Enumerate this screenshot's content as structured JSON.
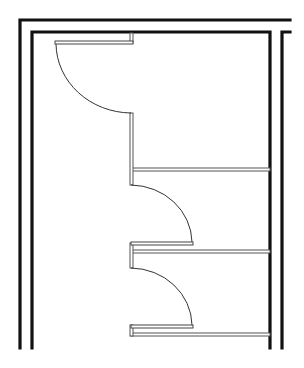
{
  "diagram": {
    "type": "floor-plan",
    "colors": {
      "wall": "#111111",
      "partition": "#555555",
      "door_swing": "#333333",
      "background": "#ffffff"
    },
    "walls": [
      {
        "name": "outer-wall-top",
        "points": [
          [
            20,
            348
          ],
          [
            20,
            20
          ],
          [
            290,
            20
          ]
        ]
      },
      {
        "name": "inner-wall",
        "points": [
          [
            32,
            348
          ],
          [
            32,
            32
          ],
          [
            270,
            32
          ],
          [
            270,
            348
          ]
        ]
      },
      {
        "name": "outer-wall-right",
        "points": [
          [
            290,
            32
          ],
          [
            282,
            32
          ],
          [
            282,
            348
          ]
        ]
      }
    ],
    "partitions": [
      {
        "name": "stall-partition-1",
        "x": 131,
        "y": 168,
        "w": 139,
        "h": 3
      },
      {
        "name": "stall-partition-2",
        "x": 131,
        "y": 250,
        "w": 139,
        "h": 3
      },
      {
        "name": "stall-partition-3",
        "x": 131,
        "y": 333,
        "w": 139,
        "h": 3
      },
      {
        "name": "pilaster-1",
        "x": 130,
        "y": 33,
        "w": 3,
        "h": 10
      },
      {
        "name": "pilaster-2",
        "x": 130,
        "y": 113,
        "w": 3,
        "h": 72
      },
      {
        "name": "pilaster-3",
        "x": 130,
        "y": 243,
        "w": 3,
        "h": 25
      },
      {
        "name": "pilaster-4",
        "x": 130,
        "y": 325,
        "w": 3,
        "h": 11
      }
    ],
    "doors": [
      {
        "name": "door-1",
        "leaf": {
          "x": 55,
          "y": 41,
          "w": 78,
          "h": 3
        },
        "arc": "M 56 44 A 76 70 0 0 0 131 113"
      },
      {
        "name": "door-2",
        "leaf": {
          "x": 131,
          "y": 242,
          "w": 62,
          "h": 3
        },
        "arc": "M 131 185 A 62 58 0 0 1 192 242"
      },
      {
        "name": "door-3",
        "leaf": {
          "x": 131,
          "y": 325,
          "w": 62,
          "h": 3
        },
        "arc": "M 131 268 A 62 58 0 0 1 192 325"
      }
    ]
  }
}
